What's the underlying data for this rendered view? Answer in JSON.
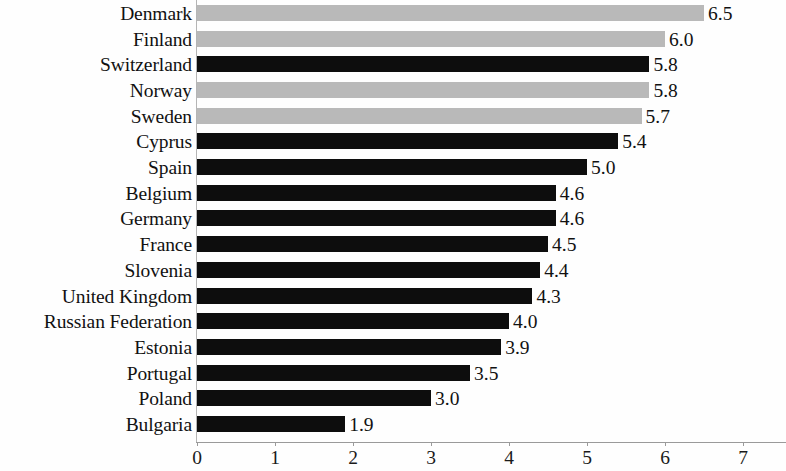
{
  "chart_data": {
    "type": "bar",
    "orientation": "horizontal",
    "title": "",
    "subtitle": "",
    "xlabel": "",
    "ylabel": "",
    "xlim": [
      0,
      7.4
    ],
    "xticks": [
      "0",
      "1",
      "2",
      "3",
      "4",
      "5",
      "6",
      "7"
    ],
    "xtick_values": [
      0,
      1,
      2,
      3,
      4,
      5,
      6,
      7
    ],
    "grid": false,
    "legend": "none",
    "categories": [
      "Denmark",
      "Finland",
      "Switzerland",
      "Norway",
      "Sweden",
      "Cyprus",
      "Spain",
      "Belgium",
      "Germany",
      "France",
      "Slovenia",
      "United Kingdom",
      "Russian Federation",
      "Estonia",
      "Portugal",
      "Poland",
      "Bulgaria"
    ],
    "values": [
      6.5,
      6.0,
      5.8,
      5.8,
      5.7,
      5.4,
      5.0,
      4.6,
      4.6,
      4.5,
      4.4,
      4.3,
      4.0,
      3.9,
      3.5,
      3.0,
      1.9
    ],
    "value_labels": [
      "6.5",
      "6.0",
      "5.8",
      "5.8",
      "5.7",
      "5.4",
      "5.0",
      "4.6",
      "4.6",
      "4.5",
      "4.4",
      "4.3",
      "4.0",
      "3.9",
      "3.5",
      "3.0",
      "1.9"
    ],
    "bar_colors": [
      "#b9b9b9",
      "#b9b9b9",
      "#0d0d0d",
      "#b9b9b9",
      "#b9b9b9",
      "#0d0d0d",
      "#0d0d0d",
      "#0d0d0d",
      "#0d0d0d",
      "#0d0d0d",
      "#0d0d0d",
      "#0d0d0d",
      "#0d0d0d",
      "#0d0d0d",
      "#0d0d0d",
      "#0d0d0d",
      "#0d0d0d"
    ],
    "color_groups": [
      "light",
      "light",
      "dark",
      "light",
      "light",
      "dark",
      "dark",
      "dark",
      "dark",
      "dark",
      "dark",
      "dark",
      "dark",
      "dark",
      "dark",
      "dark",
      "dark"
    ],
    "palette": {
      "dark": "#0d0d0d",
      "light": "#b9b9b9",
      "axis": "#9a9a9a",
      "text": "#111111",
      "background": "#fefefe"
    }
  }
}
